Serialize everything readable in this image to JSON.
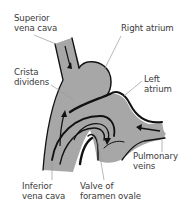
{
  "diagram": {
    "colors": {
      "fill": "#a7a7a7",
      "outline": "#111111",
      "leader": "#9a9a9a",
      "text": "#3a3a3a"
    },
    "labels": [
      {
        "id": "superior-vena-cava",
        "lines": [
          "Superior",
          "vena cava"
        ]
      },
      {
        "id": "right-atrium",
        "lines": [
          "Right atrium"
        ]
      },
      {
        "id": "crista-dividens",
        "lines": [
          "Crista",
          "dividens"
        ]
      },
      {
        "id": "left-atrium",
        "lines": [
          "Left",
          "atrium"
        ]
      },
      {
        "id": "pulmonary-veins",
        "lines": [
          "Pulmonary",
          "veins"
        ]
      },
      {
        "id": "inferior-vena-cava",
        "lines": [
          "Inferior",
          "vena cava"
        ]
      },
      {
        "id": "valve-of-foramen-ovale",
        "lines": [
          "Valve of",
          "foramen ovale"
        ]
      }
    ]
  }
}
